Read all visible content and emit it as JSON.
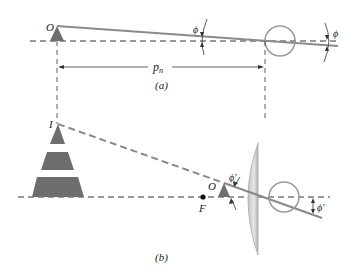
{
  "diagram": {
    "panel_a": {
      "caption": "(a)",
      "object_label": "O",
      "distance_label": "p",
      "distance_subscript": "n",
      "angle_label": "ϕ"
    },
    "panel_b": {
      "caption": "(b)",
      "image_label": "I",
      "object_label": "O",
      "focal_point_label": "F",
      "angle_label": "ϕ′"
    },
    "colors": {
      "ray": "#8a8a8a",
      "axis": "#333333",
      "object_fill": "#6e6e6e",
      "eye": "#9a9a9a",
      "lens_light": "#e8e8e8",
      "lens_dark": "#b4b4b4"
    }
  }
}
